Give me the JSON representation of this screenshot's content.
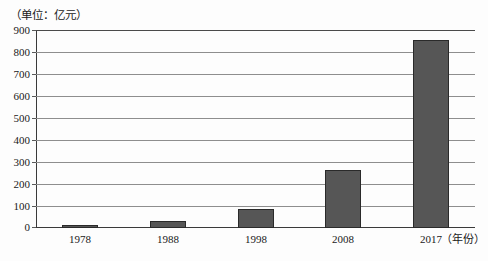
{
  "chart_data": {
    "type": "bar",
    "title": "",
    "subtitle": "",
    "unit_caption": "（单位：亿元）",
    "xlabel": "（年份）",
    "ylabel": "",
    "categories": [
      "1978",
      "1988",
      "1998",
      "2008",
      "2017"
    ],
    "values": [
      10,
      30,
      85,
      265,
      855
    ],
    "ylim": [
      0,
      900
    ],
    "ytick_interval": 100,
    "yticks": [
      "900",
      "800",
      "700",
      "600",
      "500",
      "400",
      "300",
      "200",
      "100",
      "0"
    ],
    "ytick_values": [
      900,
      800,
      700,
      600,
      500,
      400,
      300,
      200,
      100,
      0
    ],
    "grid": true,
    "legend": false,
    "legend_position": "none",
    "bar_color": "#565656",
    "bar_border_color": "#2a2a2a",
    "gridline_color": "#8e8e8e",
    "axis_color": "#3a3a3a",
    "background_color": "#fdfdfd",
    "text_color": "#1a1a1a"
  }
}
